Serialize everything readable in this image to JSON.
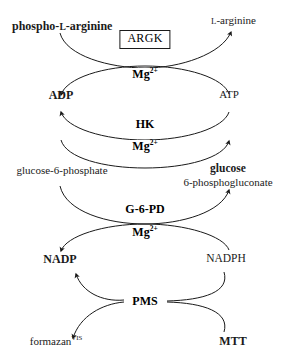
{
  "diagram": {
    "stroke_color": "#1a1a1a",
    "background_color": "#ffffff",
    "enzymes": [
      {
        "id": "argk",
        "label": "ARGK",
        "boxed": true
      },
      {
        "id": "hk",
        "label": "HK",
        "boxed": false
      },
      {
        "id": "g6pd",
        "label": "G-6-PD",
        "boxed": false
      },
      {
        "id": "pms",
        "label": "PMS",
        "boxed": false
      }
    ],
    "cofactors": [
      {
        "id": "mg-1",
        "base": "Mg",
        "sup": "2+"
      },
      {
        "id": "mg-2",
        "base": "Mg",
        "sup": "2+"
      },
      {
        "id": "mg-3",
        "base": "Mg",
        "sup": "2+"
      }
    ],
    "metabolites": {
      "phospho_l_arginine": {
        "prefix": "phospho-",
        "smallcap": "l",
        "suffix": "-arginine",
        "bold": true
      },
      "l_arginine": {
        "smallcap": "l",
        "suffix": "-arginine",
        "bold": false
      },
      "adp": {
        "label": "ADP",
        "bold": true
      },
      "atp": {
        "label": "ATP",
        "bold": false
      },
      "glucose_6_phosphate": {
        "label": "glucose-6-phosphate",
        "bold": false
      },
      "glucose": {
        "label": "glucose",
        "bold": true
      },
      "phosphogluconate": {
        "label": "6-phosphogluconate",
        "bold": false
      },
      "nadp": {
        "label": "NADP",
        "bold": true
      },
      "nadph": {
        "label": "NADPH",
        "bold": false
      },
      "formazan": {
        "base": "formazan",
        "sup": "VIS",
        "bold": false
      },
      "mtt": {
        "label": "MTT",
        "bold": true
      }
    }
  }
}
